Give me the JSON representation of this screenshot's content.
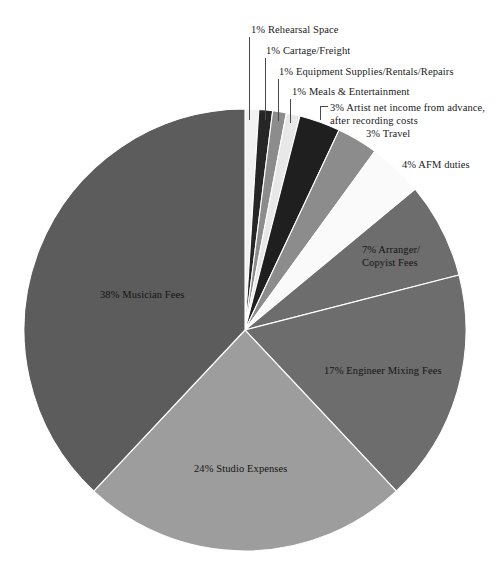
{
  "chart_data": {
    "type": "pie",
    "title": "",
    "subtitle": "",
    "legend_position": "callout-labels",
    "grid": false,
    "units": "percent",
    "start_angle_deg": 0,
    "direction": "clockwise",
    "categories": [
      "Rehearsal Space",
      "Cartage/Freight",
      "Equipment Supplies/Rentals/Repairs",
      "Meals & Entertainment",
      "Artist net income from advance, after recording costs",
      "Travel",
      "AFM duties",
      "Arranger/Copyist Fees",
      "Engineer Mixing Fees",
      "Studio Expenses",
      "Musician Fees"
    ],
    "values": [
      1,
      1,
      1,
      1,
      3,
      3,
      4,
      7,
      17,
      24,
      38
    ],
    "colors": [
      "#f2f2f2",
      "#262626",
      "#8c8c8c",
      "#e8e8e8",
      "#1f1f1f",
      "#8c8c8c",
      "#fafafa",
      "#6d6d6d",
      "#6d6d6d",
      "#9d9d9d",
      "#5c5c5c"
    ],
    "slices": [
      {
        "label": "Rehearsal Space",
        "value": 1,
        "display": "1% Rehearsal Space",
        "color": "#f2f2f2"
      },
      {
        "label": "Cartage/Freight",
        "value": 1,
        "display": "1% Cartage/Freight",
        "color": "#262626"
      },
      {
        "label": "Equipment Supplies/Rentals/Repairs",
        "value": 1,
        "display": "1% Equipment Supplies/Rentals/Repairs",
        "color": "#8c8c8c"
      },
      {
        "label": "Meals & Entertainment",
        "value": 1,
        "display": "1% Meals & Entertainment",
        "color": "#e8e8e8"
      },
      {
        "label": "Artist net income from advance, after recording costs",
        "value": 3,
        "display": "3% Artist net income from advance, after recording costs",
        "color": "#1f1f1f"
      },
      {
        "label": "Travel",
        "value": 3,
        "display": "3% Travel",
        "color": "#8c8c8c"
      },
      {
        "label": "AFM duties",
        "value": 4,
        "display": "4% AFM duties",
        "color": "#fafafa"
      },
      {
        "label": "Arranger/Copyist Fees",
        "value": 7,
        "display": "7% Arranger/Copyist Fees",
        "color": "#6d6d6d"
      },
      {
        "label": "Engineer Mixing Fees",
        "value": 17,
        "display": "17% Engineer Mixing Fees",
        "color": "#6d6d6d"
      },
      {
        "label": "Studio Expenses",
        "value": 24,
        "display": "24% Studio Expenses",
        "color": "#9d9d9d"
      },
      {
        "label": "Musician Fees",
        "value": 38,
        "display": "38% Musician Fees",
        "color": "#5c5c5c"
      }
    ]
  },
  "labels": {
    "rehearsal_space": "1% Rehearsal Space",
    "cartage_freight": "1% Cartage/Freight",
    "equipment": "1% Equipment Supplies/Rentals/Repairs",
    "meals": "1% Meals & Entertainment",
    "artist_net_income": "3% Artist net income from advance, after recording costs",
    "travel": "3% Travel",
    "afm_duties": "4% AFM duties",
    "arranger_copyist": "7% Arranger/ Copyist Fees",
    "engineer_mixing": "17% Engineer Mixing Fees",
    "studio_expenses": "24% Studio Expenses",
    "musician_fees": "38% Musician Fees"
  }
}
